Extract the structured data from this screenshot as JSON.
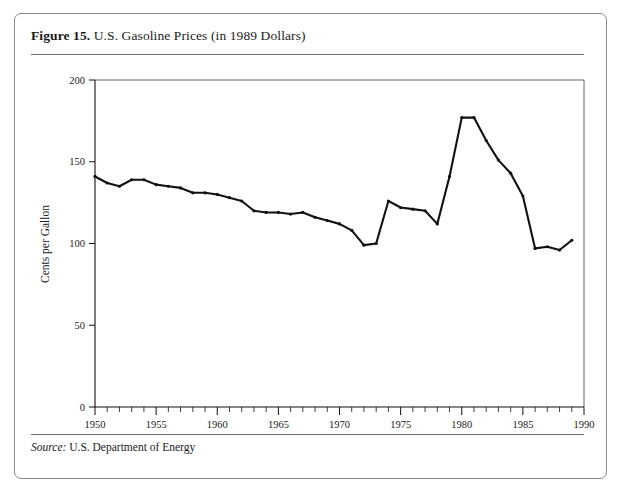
{
  "figure": {
    "number_label": "Figure 15.",
    "title_text": " U.S. Gasoline Prices (in 1989 Dollars)",
    "source_label": "Source:",
    "source_text": " U.S. Department of Energy"
  },
  "chart_data": {
    "type": "line",
    "title": "U.S. Gasoline Prices (in 1989 Dollars)",
    "xlabel": "",
    "ylabel": "Cents per Gallon",
    "xlim": [
      1950,
      1990
    ],
    "ylim": [
      0,
      200
    ],
    "yticks": [
      0,
      50,
      100,
      150,
      200
    ],
    "ytick_labels": [
      "0",
      "50",
      "100",
      "150",
      "200"
    ],
    "xticks": [
      1950,
      1955,
      1960,
      1965,
      1970,
      1975,
      1980,
      1985,
      1990
    ],
    "xtick_labels": [
      "1950",
      "1955",
      "1960",
      "1965",
      "1970",
      "1975",
      "1980",
      "1985",
      "1990"
    ],
    "x_minor_tick_step": 1,
    "grid": false,
    "legend": "none",
    "series": [
      {
        "name": "Gasoline price (1989 cents per gallon)",
        "x": [
          1950,
          1951,
          1952,
          1953,
          1954,
          1955,
          1956,
          1957,
          1958,
          1959,
          1960,
          1961,
          1962,
          1963,
          1964,
          1965,
          1966,
          1967,
          1968,
          1969,
          1970,
          1971,
          1972,
          1973,
          1974,
          1975,
          1976,
          1977,
          1978,
          1979,
          1980,
          1981,
          1982,
          1983,
          1984,
          1985,
          1986,
          1987,
          1988,
          1989
        ],
        "values": [
          141,
          137,
          135,
          139,
          139,
          136,
          135,
          134,
          131,
          131,
          130,
          128,
          126,
          120,
          119,
          119,
          118,
          119,
          116,
          114,
          112,
          108,
          99,
          100,
          126,
          122,
          121,
          120,
          112,
          141,
          177,
          177,
          163,
          151,
          143,
          129,
          97,
          98,
          96,
          102
        ]
      }
    ]
  }
}
